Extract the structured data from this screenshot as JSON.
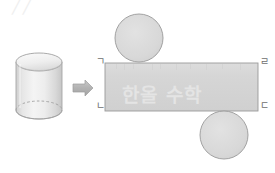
{
  "diagram": {
    "background_color": "#ffffff",
    "fill_color": "#d4d4d4",
    "stroke_color": "#9a9a9a",
    "arrow_color": "#b0b0b0",
    "label_color": "#6e6e6e",
    "watermark_color": "#e8e8e8"
  },
  "solid": {
    "name": "cylinder",
    "center_x": 39,
    "center_y": 88,
    "body_width": 46,
    "body_height": 48,
    "ellipse_ry": 9
  },
  "arrow": {
    "symbol": "➡",
    "x": 72,
    "y": 80,
    "width": 22,
    "height": 20
  },
  "net": {
    "rectangle": {
      "name": "lateral-surface",
      "x": 105,
      "y": 63,
      "width": 153,
      "height": 48
    },
    "circles": [
      {
        "name": "top-base-circle",
        "cx": 139,
        "cy": 38,
        "r": 24
      },
      {
        "name": "bottom-base-circle",
        "cx": 224,
        "cy": 135,
        "r": 24
      }
    ],
    "corner_labels": [
      {
        "name": "corner-top-left",
        "text": "ㄱ",
        "x": 96,
        "y": 58
      },
      {
        "name": "corner-top-right",
        "text": "ㄹ",
        "x": 260,
        "y": 58
      },
      {
        "name": "corner-bottom-left",
        "text": "ㄴ",
        "x": 96,
        "y": 103
      },
      {
        "name": "corner-bottom-right",
        "text": "ㄷ",
        "x": 260,
        "y": 103
      }
    ]
  },
  "watermarks": [
    {
      "name": "watermark-center",
      "text": "한올 수학",
      "x": 122,
      "y": 82,
      "size": 19
    },
    {
      "name": "watermark-corner",
      "text": "╱╱",
      "x": 12,
      "y": -2,
      "size": 16
    }
  ]
}
